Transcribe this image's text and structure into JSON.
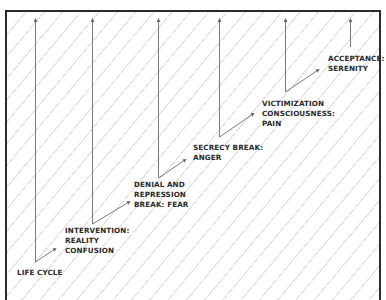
{
  "diagram": {
    "type": "staircase-stages",
    "colors": {
      "frame_border": "#2b2b2b",
      "line": "#7a7a7a",
      "hatch": "#e2e2e2",
      "text": "#2a2a2a"
    },
    "stages": [
      {
        "id": "life-cycle",
        "lines": [
          "LIFE CYCLE"
        ]
      },
      {
        "id": "intervention",
        "lines": [
          "INTERVENTION:",
          "REALITY",
          "CONFUSION"
        ]
      },
      {
        "id": "denial",
        "lines": [
          "DENIAL AND",
          "REPRESSION",
          "BREAK: FEAR"
        ]
      },
      {
        "id": "secrecy",
        "lines": [
          "SECRECY BREAK:",
          "ANGER"
        ]
      },
      {
        "id": "victimization",
        "lines": [
          "VICTIMIZATION",
          "CONSCIOUSNESS:",
          "PAIN"
        ]
      },
      {
        "id": "acceptance",
        "lines": [
          "ACCEPTANCE:",
          "SERENITY"
        ]
      }
    ]
  }
}
